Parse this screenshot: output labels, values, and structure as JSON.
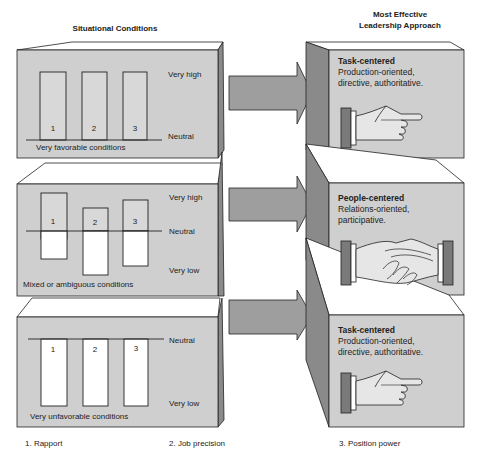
{
  "headers": {
    "left": "Situational Conditions",
    "right_line1": "Most Effective",
    "right_line2": "Leadership Approach"
  },
  "scale_labels": {
    "very_high": "Very high",
    "neutral": "Neutral",
    "very_low": "Very low"
  },
  "situations": [
    {
      "caption": "Very favorable conditions",
      "bars": [
        {
          "label": "1",
          "level": "very high"
        },
        {
          "label": "2",
          "level": "very high"
        },
        {
          "label": "3",
          "level": "very high"
        }
      ]
    },
    {
      "caption": "Mixed or ambiguous conditions",
      "bars": [
        {
          "label": "1",
          "level": "mixed"
        },
        {
          "label": "2",
          "level": "mixed"
        },
        {
          "label": "3",
          "level": "mixed"
        }
      ]
    },
    {
      "caption": "Very unfavorable conditions",
      "bars": [
        {
          "label": "1",
          "level": "very low"
        },
        {
          "label": "2",
          "level": "very low"
        },
        {
          "label": "3",
          "level": "very low"
        }
      ]
    }
  ],
  "approaches": [
    {
      "title": "Task-centered",
      "line1": "Production-oriented,",
      "line2": "directive, authoritative.",
      "icon": "pointing-hand-icon"
    },
    {
      "title": "People-centered",
      "line1": "Relations-oriented,",
      "line2": "participative.",
      "icon": "handshake-icon"
    },
    {
      "title": "Task-centered",
      "line1": "Production-oriented,",
      "line2": "directive, authoritative.",
      "icon": "pointing-hand-icon"
    }
  ],
  "legend": [
    "1. Rapport",
    "2. Job precision",
    "3. Position power"
  ],
  "colors": {
    "box_face": "#cfcfcf",
    "box_side": "#8a8a8a",
    "arrow": "#9e9e9e",
    "outline": "#222222",
    "bar_fill": "#ffffff",
    "cuff": "#7a7a7a"
  }
}
